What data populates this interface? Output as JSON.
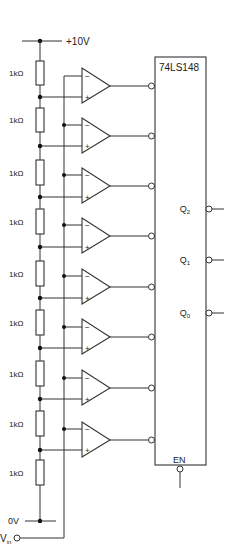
{
  "diagram": {
    "supply": {
      "top_label": "+10V",
      "bottom_label": "0V"
    },
    "input": {
      "label_main": "V",
      "label_sub": "in"
    },
    "resistors": [
      {
        "label": "1kΩ",
        "y_top": 61,
        "y_bot": 85
      },
      {
        "label": "1kΩ",
        "y_top": 108,
        "y_bot": 132
      },
      {
        "label": "1kΩ",
        "y_top": 160,
        "y_bot": 185
      },
      {
        "label": "1kΩ",
        "y_top": 209,
        "y_bot": 234
      },
      {
        "label": "1kΩ",
        "y_top": 261,
        "y_bot": 286
      },
      {
        "label": "1kΩ",
        "y_top": 310,
        "y_bot": 335
      },
      {
        "label": "1kΩ",
        "y_top": 361,
        "y_bot": 386
      },
      {
        "label": "1kΩ",
        "y_top": 411,
        "y_bot": 436
      },
      {
        "label": "1kΩ",
        "y_top": 460,
        "y_bot": 485
      }
    ],
    "comparators": [
      {
        "input": "H",
        "out_y": 86,
        "minus_y": 76,
        "plus_y": 97,
        "bus_dot": false
      },
      {
        "input": "G",
        "out_y": 136,
        "minus_y": 125,
        "plus_y": 146,
        "bus_dot": true
      },
      {
        "input": "F",
        "out_y": 186,
        "minus_y": 175,
        "plus_y": 197,
        "bus_dot": true
      },
      {
        "input": "E",
        "out_y": 236,
        "minus_y": 225,
        "plus_y": 247,
        "bus_dot": true
      },
      {
        "input": "D",
        "out_y": 287,
        "minus_y": 276,
        "plus_y": 298,
        "bus_dot": true
      },
      {
        "input": "C",
        "out_y": 337,
        "minus_y": 327,
        "plus_y": 348,
        "bus_dot": true
      },
      {
        "input": "B",
        "out_y": 388,
        "minus_y": 378,
        "plus_y": 399,
        "bus_dot": true
      },
      {
        "input": "A",
        "out_y": 440,
        "minus_y": 429,
        "plus_y": 450,
        "bus_dot": true
      }
    ],
    "comparator_symbols": {
      "minus": "−",
      "plus": "+"
    },
    "encoder": {
      "part_number": "74LS148",
      "outputs": [
        {
          "label": "Q",
          "sub": "2",
          "y": 209
        },
        {
          "label": "Q",
          "sub": "1",
          "y": 260
        },
        {
          "label": "Q",
          "sub": "0",
          "y": 313
        }
      ],
      "enable_label": "EN"
    },
    "colors": {
      "line": "#333333",
      "background": "#ffffff",
      "text": "#222222"
    }
  }
}
